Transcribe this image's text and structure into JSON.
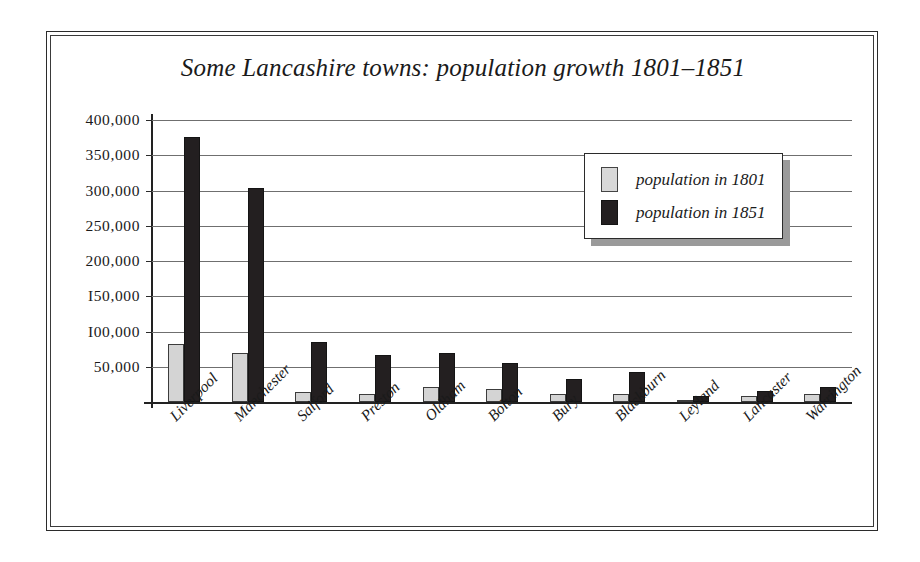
{
  "chart_data": {
    "type": "bar",
    "title": "Some Lancashire towns: population growth 1801–1851",
    "xlabel": "",
    "ylabel": "",
    "ylim": [
      0,
      400000
    ],
    "grid": true,
    "legend_position": "upper-right-inside",
    "y_ticks": [
      400000,
      350000,
      300000,
      250000,
      200000,
      150000,
      100000,
      50000
    ],
    "y_tick_labels": [
      "400,000",
      "350,000",
      "300,000",
      "250,000",
      "200,000",
      "I50,000",
      "I00,000",
      "50,000"
    ],
    "categories": [
      "Liverpool",
      "Manchester",
      "Salford",
      "Preston",
      "Oldham",
      "Bolton",
      "Bury",
      "Blackburn",
      "Leyland",
      "Lancaster",
      "Warrington"
    ],
    "series": [
      {
        "name": "population in 1801",
        "color": "#d4d4d4",
        "values": [
          82000,
          70000,
          14000,
          12000,
          22000,
          18000,
          11000,
          12000,
          3000,
          9000,
          11000
        ]
      },
      {
        "name": "population in 1851",
        "color": "#231f20",
        "values": [
          376000,
          303000,
          85000,
          67000,
          69000,
          56000,
          32000,
          42000,
          8000,
          16000,
          22000
        ]
      }
    ]
  },
  "legend": {
    "items": [
      {
        "label": "population in 1801",
        "swatch": "light-gray-swatch"
      },
      {
        "label": "population in 1851",
        "swatch": "black-swatch"
      }
    ]
  }
}
